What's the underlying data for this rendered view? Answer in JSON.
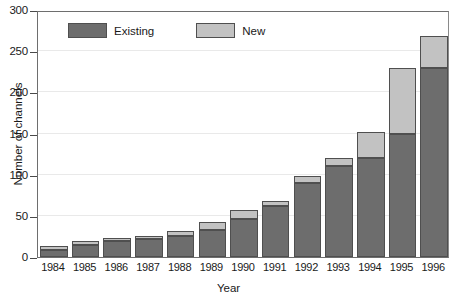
{
  "chart_data": {
    "type": "bar",
    "stacked": true,
    "title": "",
    "xlabel": "Year",
    "ylabel": "Number of channels",
    "categories": [
      "1984",
      "1985",
      "1986",
      "1987",
      "1988",
      "1989",
      "1990",
      "1991",
      "1992",
      "1993",
      "1994",
      "1995",
      "1996"
    ],
    "series": [
      {
        "name": "Existing",
        "color": "#6d6d6d",
        "values": [
          9,
          14,
          19,
          22,
          26,
          33,
          46,
          62,
          90,
          110,
          120,
          150,
          230
        ]
      },
      {
        "name": "New",
        "color": "#c2c2c2",
        "values": [
          4,
          5,
          4,
          4,
          5,
          10,
          11,
          6,
          8,
          10,
          32,
          80,
          38
        ]
      }
    ],
    "totals": [
      13,
      19,
      23,
      26,
      31,
      43,
      57,
      68,
      98,
      120,
      152,
      230,
      268
    ],
    "ylim": [
      0,
      300
    ],
    "yticks": [
      0,
      50,
      100,
      150,
      200,
      250,
      300
    ],
    "ytick_labels": [
      "0",
      "50",
      "100",
      "150",
      "200",
      "250",
      "300"
    ],
    "grid": true,
    "legend_position": "top-left-inside"
  },
  "legend": {
    "items": [
      {
        "label": "Existing",
        "color": "#6d6d6d"
      },
      {
        "label": "New",
        "color": "#c2c2c2"
      }
    ]
  }
}
